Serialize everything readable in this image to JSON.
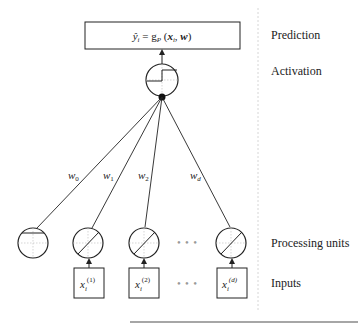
{
  "prediction": {
    "formula_main": "ŷ",
    "formula_sub": "i",
    "formula_rest": " = g",
    "formula_g_sub": "P",
    "formula_args_open": " (",
    "formula_x": "x",
    "formula_x_sub": "i",
    "formula_comma": ", ",
    "formula_w": "w",
    "formula_close": ")"
  },
  "layer_labels": {
    "prediction": "Prediction",
    "activation": "Activation",
    "processing_units": "Processing units",
    "inputs": "Inputs"
  },
  "weights": [
    {
      "base": "w",
      "sub": "0"
    },
    {
      "base": "w",
      "sub": "1"
    },
    {
      "base": "w",
      "sub": "2"
    },
    {
      "base": "w",
      "sub": "d"
    }
  ],
  "inputs": [
    {
      "base": "x",
      "sub": "i",
      "sup": "(1)"
    },
    {
      "base": "x",
      "sub": "i",
      "sup": "(2)"
    },
    {
      "base": "x",
      "sub": "i",
      "sup": "(d)"
    }
  ],
  "ellipsis": "• • •",
  "colors": {
    "stroke": "#222222",
    "grid": "#bbbbbb",
    "dots": "#999999",
    "divider": "#cccccc",
    "bottom_rule": "#888888"
  }
}
